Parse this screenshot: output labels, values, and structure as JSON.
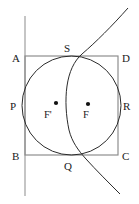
{
  "figure": {
    "width": 139,
    "height": 204,
    "background_color": "#ffffff",
    "stroke_color_curves": "#2b2b2b",
    "stroke_color_frame": "#8a8a8a",
    "dot_color": "#111111"
  },
  "labels": {
    "A": "A",
    "B": "B",
    "C": "C",
    "D": "D",
    "P": "P",
    "Q": "Q",
    "R": "R",
    "S": "S",
    "F": "F",
    "F_prime": "F'"
  },
  "points": {
    "A": {
      "label_x": 12,
      "label_y": 62,
      "x": 25,
      "y": 56
    },
    "D": {
      "label_x": 122,
      "label_y": 62,
      "x": 118,
      "y": 56
    },
    "B": {
      "label_x": 12,
      "label_y": 160,
      "x": 25,
      "y": 155
    },
    "C": {
      "label_x": 122,
      "label_y": 160,
      "x": 118,
      "y": 155
    },
    "P": {
      "label_x": 10,
      "label_y": 110,
      "x": 25,
      "y": 105.5
    },
    "R": {
      "label_x": 123,
      "label_y": 110,
      "x": 118,
      "y": 105.5
    },
    "S": {
      "label_x": 64,
      "label_y": 52,
      "x": 71.5,
      "y": 56
    },
    "Q": {
      "label_x": 64,
      "label_y": 170,
      "x": 71.5,
      "y": 155
    },
    "F": {
      "label_x": 85,
      "label_y": 118,
      "dot_x": 88,
      "dot_y": 104
    },
    "F_prime": {
      "label_x": 44,
      "label_y": 118,
      "dot_x": 56,
      "dot_y": 103
    }
  },
  "shapes": {
    "rectangle": {
      "name": "rectangle-ABCD",
      "left": 25,
      "top": 56,
      "right": 118,
      "bottom": 155
    },
    "circle": {
      "name": "inscribed-circle",
      "center_x": 71.5,
      "center_y": 105.5,
      "radius": 49.5
    },
    "directrix": {
      "name": "vertical-directrix",
      "x": 25,
      "y_top": 16,
      "y_bottom": 196
    },
    "parabola": {
      "name": "parabola-through-S-and-Q",
      "path": "M 128 8 C 112 26 96 42 82 54 C 74 61 69 72 67 86 C 65 100 66 116 69 130 C 72 142 78 150 86 159 C 96 170 108 182 120 194"
    }
  }
}
